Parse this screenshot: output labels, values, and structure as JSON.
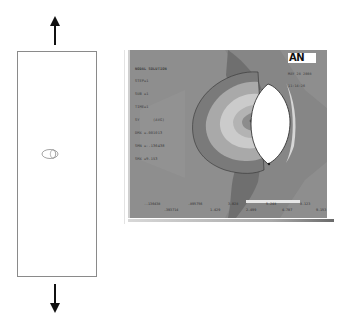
{
  "figure": {
    "load_arrows": {
      "top": "up",
      "bottom": "down"
    }
  },
  "plot": {
    "title": "NODAL SOLUTION",
    "info_lines": [
      "STEP=1",
      "SUB =1",
      "TIME=1",
      "SY      (AVG)",
      "DMX =.001013",
      "SMN =-.136438",
      "SMX =9.153"
    ],
    "logo": "AN",
    "logo_date": [
      "MAY 28 2008",
      "11:14:26"
    ],
    "legend": {
      "label": "■",
      "top_row": [
        "-.136438",
        ".895756",
        "3.028",
        "5.248",
        "8.123"
      ],
      "bottom_row": [
        ".393714",
        "1.429",
        "2.499",
        "4.707",
        "9.153"
      ]
    },
    "colors": {
      "background": "#8e8e8e",
      "outer_contour": "#7a7a7a",
      "mid_contour": "#a8a8a8",
      "light_contour": "#c9c9c9",
      "inner_contour": "#b4b4b4",
      "core_contour": "#8a8a8a",
      "hole": "#ffffff"
    }
  }
}
